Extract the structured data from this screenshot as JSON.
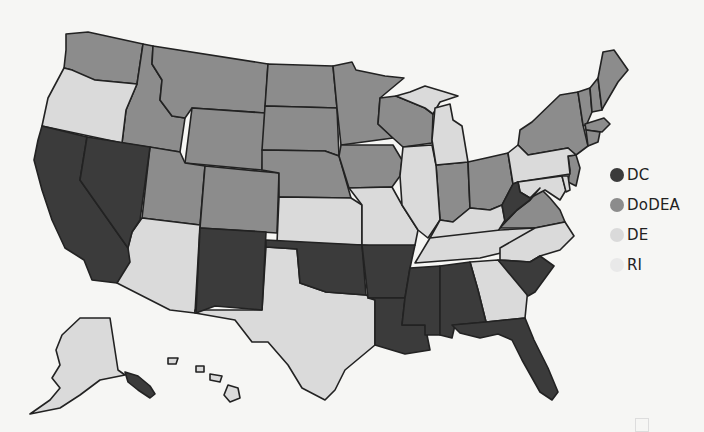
{
  "map": {
    "type": "choropleth",
    "region": "United States",
    "categories": [
      {
        "key": "DC",
        "label": "DC",
        "color": "#3b3b3b"
      },
      {
        "key": "DoDEA",
        "label": "DoDEA",
        "color": "#8c8c8c"
      },
      {
        "key": "DE",
        "label": "DE",
        "color": "#dadada"
      },
      {
        "key": "RI",
        "label": "RI",
        "color": "#e9e9e9"
      }
    ],
    "states": {
      "DC": [
        "CA",
        "NV",
        "NM",
        "OK",
        "AR",
        "LA",
        "MS",
        "AL",
        "FL",
        "SC",
        "WV"
      ],
      "DoDEA": [
        "WA",
        "ID",
        "MT",
        "WY",
        "UT",
        "CO",
        "ND",
        "SD",
        "NE",
        "MN",
        "IA",
        "WI",
        "IN",
        "OH",
        "VA",
        "NY",
        "VT",
        "NH",
        "ME",
        "MA",
        "CT",
        "NJ"
      ],
      "DE": [
        "OR",
        "AZ",
        "TX",
        "KS",
        "MO",
        "IL",
        "MI",
        "KY",
        "TN",
        "NC",
        "GA",
        "PA",
        "MD",
        "DE",
        "AK",
        "HI"
      ]
    }
  },
  "legend": {
    "items": [
      {
        "label": "DC",
        "color": "#3b3b3b"
      },
      {
        "label": "DoDEA",
        "color": "#8c8c8c"
      },
      {
        "label": "DE",
        "color": "#dadada"
      },
      {
        "label": "RI",
        "color": "#e9e9e9"
      }
    ]
  }
}
